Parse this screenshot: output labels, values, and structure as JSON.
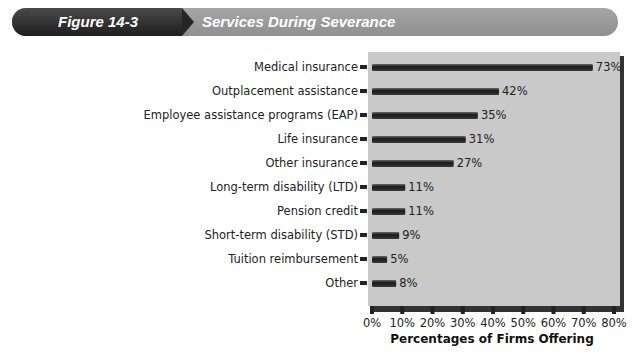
{
  "header": {
    "figure_label": "Figure 14-3",
    "figure_title": "Services During Severance"
  },
  "chart_data": {
    "type": "bar",
    "orientation": "horizontal",
    "title": "Services During Severance",
    "categories": [
      "Medical insurance",
      "Outplacement assistance",
      "Employee assistance programs (EAP)",
      "Life insurance",
      "Other insurance",
      "Long-term disability (LTD)",
      "Pension credit",
      "Short-term disability (STD)",
      "Tuition reimbursement",
      "Other"
    ],
    "values": [
      73,
      42,
      35,
      31,
      27,
      11,
      11,
      9,
      5,
      8
    ],
    "value_labels": [
      "73%",
      "42%",
      "35%",
      "31%",
      "27%",
      "11%",
      "11%",
      "9%",
      "5%",
      "8%"
    ],
    "xlabel": "Percentages of Firms Offering",
    "ylabel": "",
    "xlim": [
      0,
      80
    ],
    "xticks": [
      "0%",
      "10%",
      "20%",
      "30%",
      "40%",
      "50%",
      "60%",
      "70%",
      "80%"
    ],
    "grid": false,
    "colors": {
      "plot_bg": "#c9c9c9",
      "bar": "#1f1f1f"
    }
  }
}
